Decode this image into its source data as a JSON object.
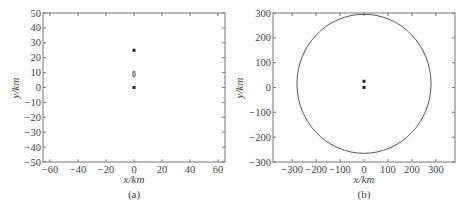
{
  "chart_data": [
    {
      "type": "scatter",
      "panel": "(a)",
      "xlabel": "x/km",
      "ylabel": "y/km",
      "xlim": [
        -65,
        65
      ],
      "ylim": [
        -50,
        50
      ],
      "xticks": [
        -60,
        -40,
        -20,
        0,
        20,
        40,
        60
      ],
      "yticks": [
        -50,
        -40,
        -30,
        -20,
        -10,
        0,
        10,
        20,
        30,
        40,
        50
      ],
      "grid": false,
      "points": [
        {
          "x": 0,
          "y": 25,
          "marker": "filled-dot"
        },
        {
          "x": 0,
          "y": 0,
          "marker": "filled-dot"
        }
      ],
      "shapes": [
        {
          "type": "ellipse",
          "cx": 0,
          "cy": 9,
          "rx": 0.8,
          "ry": 2.2,
          "fill": "none"
        }
      ]
    },
    {
      "type": "scatter",
      "panel": "(b)",
      "xlabel": "x/km",
      "ylabel": "y/km",
      "xlim": [
        -380,
        380
      ],
      "ylim": [
        -300,
        300
      ],
      "xticks": [
        -300,
        -200,
        -100,
        0,
        100,
        200,
        300
      ],
      "yticks": [
        -300,
        -200,
        -100,
        0,
        100,
        200,
        300
      ],
      "grid": false,
      "points": [
        {
          "x": 0,
          "y": 25,
          "marker": "filled-dot"
        },
        {
          "x": 0,
          "y": 0,
          "marker": "filled-dot"
        }
      ],
      "shapes": [
        {
          "type": "circle",
          "cx": 0,
          "cy": 15,
          "r": 280,
          "fill": "none"
        }
      ]
    }
  ],
  "panels": {
    "a": {
      "caption": "(a)",
      "xlabel": "x/km",
      "ylabel": "y/km"
    },
    "b": {
      "caption": "(b)",
      "xlabel": "x/km",
      "ylabel": "y/km"
    }
  }
}
